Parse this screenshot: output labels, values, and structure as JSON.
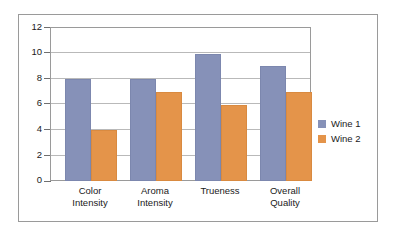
{
  "chart_data": {
    "type": "bar",
    "title": "",
    "subtitle": "",
    "xlabel": "",
    "ylabel": "",
    "categories": [
      "Color Intensity",
      "Aroma Intensity",
      "Trueness",
      "Overall Quality"
    ],
    "category_lines": [
      [
        "Color",
        "Intensity"
      ],
      [
        "Aroma",
        "Intensity"
      ],
      [
        "Trueness"
      ],
      [
        "Overall",
        "Quality"
      ]
    ],
    "series": [
      {
        "name": "Wine 1",
        "color": "#8691b8",
        "values": [
          8,
          8,
          10,
          9
        ]
      },
      {
        "name": "Wine 2",
        "color": "#e4944a",
        "values": [
          4,
          7,
          6,
          7
        ]
      }
    ],
    "ylim": [
      0,
      12
    ],
    "ytick_step": 2,
    "ytick_labels": [
      "12",
      "10",
      "8",
      "6",
      "4",
      "2",
      "0"
    ],
    "ytick_values": [
      12,
      10,
      8,
      6,
      4,
      2,
      0
    ],
    "grid": true,
    "grid_axis": "y",
    "legend_position": "right",
    "legend_entries": [
      "Wine 1",
      "Wine 2"
    ]
  },
  "colors": {
    "series_1": "#8691b8",
    "series_2": "#e4944a",
    "gridline": "#b9b9b9",
    "axis": "#6f6f6f",
    "frame_border": "#9a9a9a",
    "background": "#ffffff",
    "text": "#1a1a1a"
  }
}
